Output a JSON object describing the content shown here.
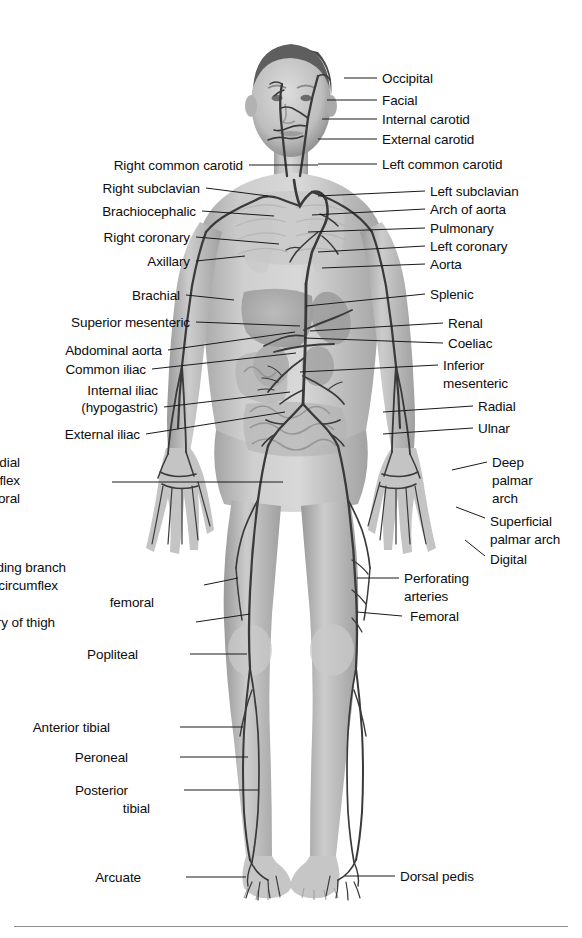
{
  "figure": {
    "orientation": "anterior",
    "style": "grayscale halftone anatomical illustration",
    "background_color": "#ffffff",
    "artery_color": "#3f3f3f",
    "body_color": "#b9b9b9",
    "leader_color": "#1a1a1a",
    "text_color": "#0d0d0d"
  },
  "labels_left": [
    {
      "text": "Right common carotid",
      "x": 243,
      "y": 165,
      "lx1": 249,
      "ly1": 165,
      "lx2": 318,
      "ly2": 165
    },
    {
      "text": "Right subclavian",
      "x": 200,
      "y": 188,
      "lx1": 206,
      "ly1": 188,
      "lx2": 268,
      "ly2": 196
    },
    {
      "text": "Brachiocephalic",
      "x": 196,
      "y": 211,
      "lx1": 202,
      "ly1": 211,
      "lx2": 274,
      "ly2": 216
    },
    {
      "text": "Right coronary",
      "x": 190,
      "y": 237,
      "lx1": 196,
      "ly1": 237,
      "lx2": 279,
      "ly2": 244
    },
    {
      "text": "Axillary",
      "x": 190,
      "y": 261,
      "lx1": 196,
      "ly1": 261,
      "lx2": 245,
      "ly2": 256
    },
    {
      "text": "Brachial",
      "x": 180,
      "y": 295,
      "lx1": 186,
      "ly1": 295,
      "lx2": 234,
      "ly2": 300
    },
    {
      "text": "Superior mesenteric",
      "x": 190,
      "y": 322,
      "lx1": 196,
      "ly1": 322,
      "lx2": 300,
      "ly2": 326
    },
    {
      "text": "Abdominal aorta",
      "x": 162,
      "y": 350,
      "lx1": 168,
      "ly1": 350,
      "lx2": 295,
      "ly2": 332
    },
    {
      "text": "Common iliac",
      "x": 146,
      "y": 369,
      "lx1": 152,
      "ly1": 369,
      "lx2": 296,
      "ly2": 353
    },
    {
      "text": "Internal iliac",
      "x": 158,
      "y": 390,
      "lx1": 0,
      "ly1": 0,
      "lx2": 0,
      "ly2": 0
    },
    {
      "text": "(hypogastric)",
      "x": 158,
      "y": 407,
      "lx1": 164,
      "ly1": 407,
      "lx2": 290,
      "ly2": 392
    },
    {
      "text": "External iliac",
      "x": 140,
      "y": 434,
      "lx1": 146,
      "ly1": 434,
      "lx2": 285,
      "ly2": 412
    },
    {
      "text": "Deep medial",
      "x": 20,
      "y": 462,
      "lx1": 0,
      "ly1": 0,
      "lx2": 0,
      "ly2": 0
    },
    {
      "text": "circumflex",
      "x": 20,
      "y": 480,
      "lx1": 112,
      "ly1": 482,
      "lx2": 283,
      "ly2": 482
    },
    {
      "text": "femoral",
      "x": 20,
      "y": 498,
      "lx1": 0,
      "ly1": 0,
      "lx2": 0,
      "ly2": 0
    },
    {
      "text": "Descending branch",
      "x": 66,
      "y": 567,
      "lx1": 0,
      "ly1": 0,
      "lx2": 0,
      "ly2": 0
    },
    {
      "text": "of lateral circumflex",
      "x": 58,
      "y": 585,
      "lx1": 204,
      "ly1": 585,
      "lx2": 238,
      "ly2": 578
    },
    {
      "text": "femoral",
      "x": 154,
      "y": 602,
      "lx1": 0,
      "ly1": 0,
      "lx2": 0,
      "ly2": 0
    },
    {
      "text": "Deep artery of thigh",
      "x": 55,
      "y": 622,
      "lx1": 196,
      "ly1": 622,
      "lx2": 250,
      "ly2": 614
    },
    {
      "text": "Popliteal",
      "x": 138,
      "y": 654,
      "lx1": 190,
      "ly1": 654,
      "lx2": 247,
      "ly2": 654
    },
    {
      "text": "Anterior tibial",
      "x": 110,
      "y": 727,
      "lx1": 180,
      "ly1": 727,
      "lx2": 243,
      "ly2": 727
    },
    {
      "text": "Peroneal",
      "x": 128,
      "y": 757,
      "lx1": 180,
      "ly1": 757,
      "lx2": 248,
      "ly2": 757
    },
    {
      "text": "Posterior",
      "x": 128,
      "y": 790,
      "lx1": 184,
      "ly1": 790,
      "lx2": 258,
      "ly2": 790
    },
    {
      "text": "tibial",
      "x": 150,
      "y": 808,
      "lx1": 0,
      "ly1": 0,
      "lx2": 0,
      "ly2": 0
    },
    {
      "text": "Arcuate",
      "x": 141,
      "y": 877,
      "lx1": 186,
      "ly1": 877,
      "lx2": 246,
      "ly2": 877
    }
  ],
  "labels_right": [
    {
      "text": "Occipital",
      "x": 382,
      "y": 78,
      "lx1": 344,
      "ly1": 78,
      "lx2": 377,
      "ly2": 78
    },
    {
      "text": "Facial",
      "x": 382,
      "y": 100,
      "lx1": 327,
      "ly1": 100,
      "lx2": 377,
      "ly2": 100
    },
    {
      "text": "Internal carotid",
      "x": 382,
      "y": 119,
      "lx1": 322,
      "ly1": 119,
      "lx2": 377,
      "ly2": 119
    },
    {
      "text": "External carotid",
      "x": 382,
      "y": 139,
      "lx1": 318,
      "ly1": 139,
      "lx2": 377,
      "ly2": 139
    },
    {
      "text": "Left common carotid",
      "x": 382,
      "y": 164,
      "lx1": 318,
      "ly1": 164,
      "lx2": 377,
      "ly2": 164
    },
    {
      "text": "Left subclavian",
      "x": 430,
      "y": 191,
      "lx1": 318,
      "ly1": 196,
      "lx2": 425,
      "ly2": 191
    },
    {
      "text": "Arch of aorta",
      "x": 430,
      "y": 209,
      "lx1": 312,
      "ly1": 215,
      "lx2": 425,
      "ly2": 209
    },
    {
      "text": "Pulmonary",
      "x": 430,
      "y": 228,
      "lx1": 308,
      "ly1": 232,
      "lx2": 425,
      "ly2": 228
    },
    {
      "text": "Left coronary",
      "x": 430,
      "y": 246,
      "lx1": 318,
      "ly1": 252,
      "lx2": 425,
      "ly2": 246
    },
    {
      "text": "Aorta",
      "x": 430,
      "y": 264,
      "lx1": 322,
      "ly1": 268,
      "lx2": 425,
      "ly2": 264
    },
    {
      "text": "Splenic",
      "x": 430,
      "y": 294,
      "lx1": 306,
      "ly1": 306,
      "lx2": 425,
      "ly2": 294
    },
    {
      "text": "Renal",
      "x": 448,
      "y": 323,
      "lx1": 310,
      "ly1": 331,
      "lx2": 443,
      "ly2": 323
    },
    {
      "text": "Coeliac",
      "x": 448,
      "y": 343,
      "lx1": 304,
      "ly1": 338,
      "lx2": 443,
      "ly2": 343
    },
    {
      "text": "Inferior",
      "x": 443,
      "y": 365,
      "lx1": 300,
      "ly1": 372,
      "lx2": 438,
      "ly2": 365
    },
    {
      "text": "mesenteric",
      "x": 443,
      "y": 383,
      "lx1": 0,
      "ly1": 0,
      "lx2": 0,
      "ly2": 0
    },
    {
      "text": "Radial",
      "x": 478,
      "y": 406,
      "lx1": 383,
      "ly1": 412,
      "lx2": 473,
      "ly2": 406
    },
    {
      "text": "Ulnar",
      "x": 478,
      "y": 428,
      "lx1": 383,
      "ly1": 434,
      "lx2": 473,
      "ly2": 428
    },
    {
      "text": "Deep",
      "x": 492,
      "y": 462,
      "lx1": 0,
      "ly1": 0,
      "lx2": 0,
      "ly2": 0
    },
    {
      "text": "palmar",
      "x": 492,
      "y": 480,
      "lx1": 452,
      "ly1": 470,
      "lx2": 487,
      "ly2": 462
    },
    {
      "text": "arch",
      "x": 492,
      "y": 498,
      "lx1": 0,
      "ly1": 0,
      "lx2": 0,
      "ly2": 0
    },
    {
      "text": "Superficial",
      "x": 490,
      "y": 521,
      "lx1": 456,
      "ly1": 507,
      "lx2": 485,
      "ly2": 518
    },
    {
      "text": "palmar arch",
      "x": 490,
      "y": 539,
      "lx1": 0,
      "ly1": 0,
      "lx2": 0,
      "ly2": 0
    },
    {
      "text": "Digital",
      "x": 490,
      "y": 559,
      "lx1": 465,
      "ly1": 540,
      "lx2": 485,
      "ly2": 556
    },
    {
      "text": "Perforating",
      "x": 404,
      "y": 578,
      "lx1": 357,
      "ly1": 578,
      "lx2": 399,
      "ly2": 578
    },
    {
      "text": "arteries",
      "x": 404,
      "y": 596,
      "lx1": 0,
      "ly1": 0,
      "lx2": 0,
      "ly2": 0
    },
    {
      "text": "Femoral",
      "x": 410,
      "y": 616,
      "lx1": 357,
      "ly1": 612,
      "lx2": 402,
      "ly2": 616
    },
    {
      "text": "Dorsal pedis",
      "x": 400,
      "y": 876,
      "lx1": 345,
      "ly1": 876,
      "lx2": 395,
      "ly2": 876
    }
  ],
  "footer": {
    "divider": "horizontal-rule"
  }
}
